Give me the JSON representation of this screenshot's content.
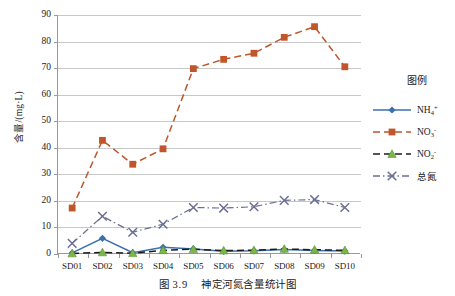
{
  "caption": {
    "prefix": "图",
    "number": "3.9",
    "text": "神定河氮含量统计图"
  },
  "legend": {
    "title": "图例",
    "entries": [
      {
        "label_html": "NH<sub>4</sub><sup>+</sup>",
        "label": "NH4+",
        "color": "#3a6fb0",
        "marker": "diamond",
        "dash": "solid"
      },
      {
        "label_html": "NO<sub>3</sub><sup>-</sup>",
        "label": "NO3-",
        "color": "#c0562a",
        "marker": "square",
        "dash": "dashed"
      },
      {
        "label_html": "NO<sub>2</sub><sup>-</sup>",
        "label": "NO2-",
        "color": "#1c1c1c",
        "marker": "triangle",
        "dash": "dashed"
      },
      {
        "label_html": "总氮",
        "label": "总氮",
        "color": "#6b6f94",
        "marker": "cross",
        "dash": "dashdot"
      }
    ]
  },
  "chart_data": {
    "type": "line",
    "xlabel": "",
    "ylabel": "含量/(mg·L)",
    "ylabel_parts": {
      "name": "含量",
      "slash": "/(",
      "unit": "mg·L",
      "close": ")"
    },
    "categories": [
      "SD01",
      "SD02",
      "SD03",
      "SD04",
      "SD05",
      "SD06",
      "SD07",
      "SD08",
      "SD09",
      "SD10"
    ],
    "ylim": [
      0,
      90
    ],
    "yticks": [
      0,
      10,
      20,
      30,
      40,
      50,
      60,
      70,
      80,
      90
    ],
    "grid": true,
    "legend_position": "right",
    "series": [
      {
        "name": "NH4+",
        "color": "#3a6fb0",
        "marker": "diamond",
        "dash": "solid",
        "values": [
          0.4,
          5.9,
          0.5,
          2.5,
          1.9,
          1.0,
          1.2,
          1.7,
          1.3,
          1.1
        ]
      },
      {
        "name": "NO3-",
        "color": "#c0562a",
        "marker": "square",
        "dash": "dashed",
        "values": [
          17.3,
          42.8,
          33.8,
          39.6,
          69.8,
          73.3,
          75.6,
          81.6,
          85.6,
          70.5
        ]
      },
      {
        "name": "NO2-",
        "color": "#1c1c1c",
        "marker": "triangle",
        "dash": "dashed",
        "values": [
          0.2,
          0.6,
          0.3,
          1.4,
          1.8,
          1.3,
          1.4,
          1.9,
          1.6,
          1.4
        ]
      },
      {
        "name": "总氮",
        "color": "#6b6f94",
        "marker": "cross",
        "dash": "dashdot",
        "values": [
          4.0,
          14.2,
          8.2,
          11.2,
          17.5,
          17.3,
          17.8,
          20.2,
          20.5,
          17.5
        ]
      }
    ]
  }
}
